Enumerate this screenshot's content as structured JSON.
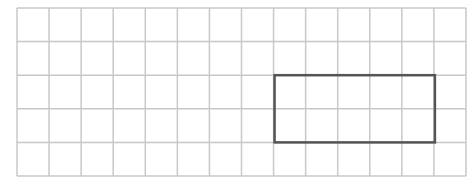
{
  "grid": {
    "columns": 14,
    "rows": 5,
    "origin_x": 17,
    "origin_y": 8,
    "cell_width": 32.07,
    "cell_height": 33.6,
    "line_color": "#c8c8c8"
  },
  "highlight_rectangle": {
    "col_start": 8,
    "col_end": 13,
    "row_start": 2,
    "row_end": 4,
    "stroke_color": "#555555",
    "width_cells": 5,
    "height_cells": 2
  }
}
